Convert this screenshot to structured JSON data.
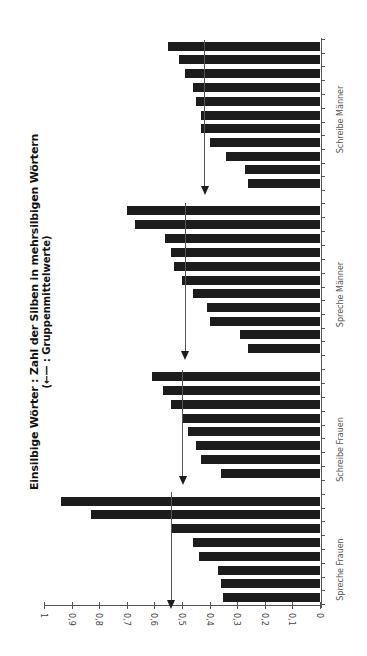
{
  "chart_data": {
    "type": "bar",
    "orientation": "rotated (value axis horizontal, decreasing left-to-right from 1 to 0; bars extend leftward)",
    "title": "Einsilbige Wörter : Zahl der Silben in mehrsilbigen Wörtern",
    "subtitle": "(←— : Gruppenmittelwerte)",
    "xlabel": "",
    "ylabel": "",
    "ylim": [
      0,
      1
    ],
    "ticks": [
      "0",
      "0,1",
      "0,2",
      "0,3",
      "0,4",
      "0,5",
      "0,6",
      "0,7",
      "0,8",
      "0,9",
      "1"
    ],
    "grid": false,
    "legend": "arrow marks group mean",
    "groups": [
      {
        "name": "Spreche Frauen",
        "values": [
          0.94,
          0.83,
          0.54,
          0.46,
          0.44,
          0.37,
          0.36,
          0.35
        ],
        "mean": 0.54
      },
      {
        "name": "Schreibe Frauen",
        "values": [
          0.61,
          0.57,
          0.54,
          0.5,
          0.48,
          0.45,
          0.43,
          0.36
        ],
        "mean": 0.5
      },
      {
        "name": "Spreche Männer",
        "values": [
          0.7,
          0.67,
          0.56,
          0.54,
          0.53,
          0.5,
          0.46,
          0.41,
          0.4,
          0.29,
          0.26
        ],
        "mean": 0.49
      },
      {
        "name": "Schreibe Männer",
        "values": [
          0.55,
          0.51,
          0.49,
          0.46,
          0.45,
          0.43,
          0.43,
          0.4,
          0.34,
          0.27,
          0.26
        ],
        "mean": 0.42
      }
    ]
  },
  "title": {
    "line1": "Einsilbige Wörter : Zahl der Silben in mehrsilbigen Wörtern",
    "line2": "(←— : Gruppenmittelwerte)"
  },
  "colors": {
    "bar": "#1c1c1c",
    "axis": "#555555",
    "background": "#ffffff"
  }
}
